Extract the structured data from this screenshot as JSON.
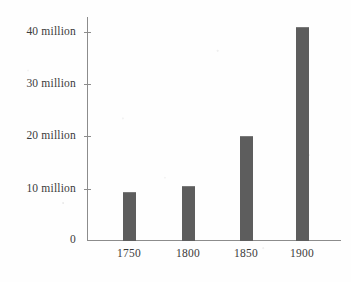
{
  "chart_data": {
    "type": "bar",
    "title": "",
    "subtitle": "",
    "xlabel": "",
    "ylabel": "",
    "categories": [
      "1750",
      "1800",
      "1850",
      "1900"
    ],
    "values": [
      9.3,
      10.3,
      20,
      41
    ],
    "value_unit": "million",
    "series": [
      {
        "name": "Population",
        "values": [
          9.3,
          10.3,
          20,
          41
        ]
      }
    ],
    "ylim": [
      0,
      43
    ],
    "y_ticks": [
      0,
      10,
      20,
      30,
      40
    ],
    "y_tick_labels": [
      "0",
      "10 million",
      "20 million",
      "30 million",
      "40 million"
    ],
    "x_tick_labels": [
      "1750",
      "1800",
      "1850",
      "1900"
    ],
    "grid": false,
    "legend": false,
    "legend_position": "none",
    "bar_color": "#5d5d5d",
    "axis_color": "#8c8c8c",
    "text_color": "#3b3b3b",
    "background_color": "#fefefe"
  },
  "axis": {
    "y_labels": {
      "t40": "40 million",
      "t30": "30 million",
      "t20": "20 million",
      "t10": "10 million",
      "t0": "0"
    },
    "x_labels": {
      "c0": "1750",
      "c1": "1800",
      "c2": "1850",
      "c3": "1900"
    }
  }
}
